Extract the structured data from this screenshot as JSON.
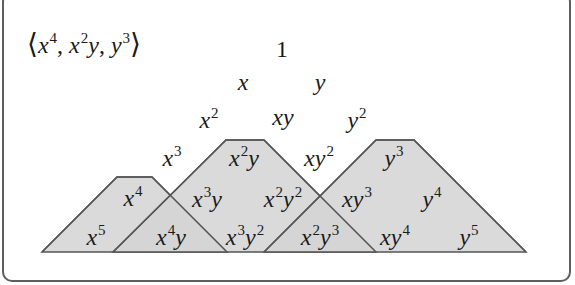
{
  "ideal": {
    "open_bracket": "⟨",
    "close_bracket": "⟩",
    "generators": [
      {
        "base": "x",
        "exp": "4",
        "base2": "",
        "exp2": ""
      },
      {
        "base": "x",
        "exp": "2",
        "base2": "y",
        "exp2": ""
      },
      {
        "base": "y",
        "exp": "3",
        "base2": "",
        "exp2": ""
      }
    ],
    "sep1": ", ",
    "sep2": ", "
  },
  "colors": {
    "fill": "#d4d4d4",
    "stroke": "#555555",
    "frame": "#5e5e5e",
    "text": "#1a1a1a"
  },
  "shapes": [
    {
      "name": "cone-x4",
      "points": "42,252 117,177 152,177 227,252"
    },
    {
      "name": "cone-x2y",
      "points": "113,252 226,140 264,140 376,252"
    },
    {
      "name": "cone-y3",
      "points": "264,252 376,140 414,140 526,252"
    }
  ],
  "monomials": [
    {
      "id": "m-1",
      "x": 282,
      "y": 49,
      "v": "1",
      "a": "",
      "b": "",
      "c": "",
      "upright": true
    },
    {
      "id": "m-x",
      "x": 243,
      "y": 82,
      "v": "x",
      "a": "",
      "b": "",
      "c": ""
    },
    {
      "id": "m-y",
      "x": 320,
      "y": 82,
      "v": "y",
      "a": "",
      "b": "",
      "c": ""
    },
    {
      "id": "m-x2",
      "x": 209,
      "y": 120,
      "v": "x",
      "a": "2",
      "b": "",
      "c": ""
    },
    {
      "id": "m-xy",
      "x": 283,
      "y": 117,
      "v": "xy",
      "a": "",
      "b": "",
      "c": ""
    },
    {
      "id": "m-y2",
      "x": 357,
      "y": 120,
      "v": "y",
      "a": "2",
      "b": "",
      "c": ""
    },
    {
      "id": "m-x3",
      "x": 172,
      "y": 158,
      "v": "x",
      "a": "3",
      "b": "",
      "c": ""
    },
    {
      "id": "m-x2y",
      "x": 244,
      "y": 158,
      "v": "x",
      "a": "2",
      "b": "y",
      "c": ""
    },
    {
      "id": "m-xy2",
      "x": 319,
      "y": 158,
      "v": "xy",
      "a": "2",
      "b": "",
      "c": ""
    },
    {
      "id": "m-y3",
      "x": 394,
      "y": 158,
      "v": "y",
      "a": "3",
      "b": "",
      "c": ""
    },
    {
      "id": "m-x4",
      "x": 133,
      "y": 198,
      "v": "x",
      "a": "4",
      "b": "",
      "c": ""
    },
    {
      "id": "m-x3y",
      "x": 207,
      "y": 199,
      "v": "x",
      "a": "3",
      "b": "y",
      "c": ""
    },
    {
      "id": "m-x2y2",
      "x": 283,
      "y": 199,
      "v": "x",
      "a": "2",
      "b": "y",
      "c": "2"
    },
    {
      "id": "m-xy3",
      "x": 357,
      "y": 199,
      "v": "xy",
      "a": "3",
      "b": "",
      "c": ""
    },
    {
      "id": "m-y4",
      "x": 432,
      "y": 199,
      "v": "y",
      "a": "4",
      "b": "",
      "c": ""
    },
    {
      "id": "m-x5",
      "x": 96,
      "y": 237,
      "v": "x",
      "a": "5",
      "b": "",
      "c": ""
    },
    {
      "id": "m-x4y",
      "x": 171,
      "y": 237,
      "v": "x",
      "a": "4",
      "b": "y",
      "c": ""
    },
    {
      "id": "m-x3y2",
      "x": 245,
      "y": 237,
      "v": "x",
      "a": "3",
      "b": "y",
      "c": "2"
    },
    {
      "id": "m-x2y3",
      "x": 320,
      "y": 237,
      "v": "x",
      "a": "2",
      "b": "y",
      "c": "3"
    },
    {
      "id": "m-xy4",
      "x": 395,
      "y": 237,
      "v": "xy",
      "a": "4",
      "b": "",
      "c": ""
    },
    {
      "id": "m-y5",
      "x": 469,
      "y": 237,
      "v": "y",
      "a": "5",
      "b": "",
      "c": ""
    }
  ]
}
